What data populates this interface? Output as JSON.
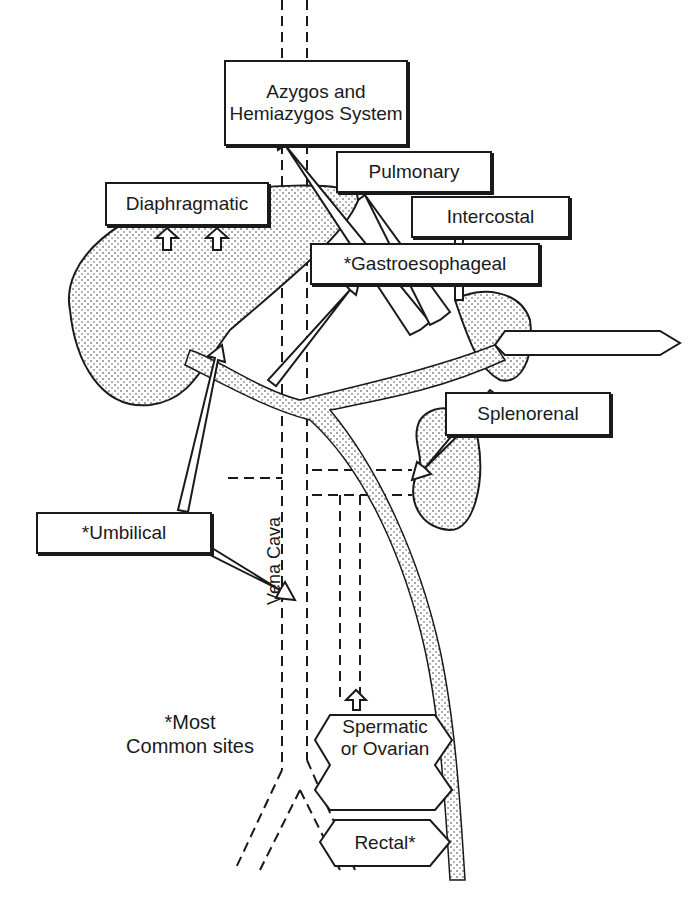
{
  "diagram": {
    "labels": {
      "azygos": "Azygos and Hemiazygos System",
      "pulmonary": "Pulmonary",
      "diaphragmatic": "Diaphragmatic",
      "intercostal": "Intercostal",
      "gastroesophageal": "*Gastroesophageal",
      "splenorenal": "Splenorenal",
      "umbilical": "*Umbilical",
      "vena_cava": "Vena Cava",
      "spermatic_ovarian": "Spermatic or Ovarian",
      "rectal": "Rectal*",
      "footnote_line1": "*Most",
      "footnote_line2": "Common sites"
    }
  }
}
